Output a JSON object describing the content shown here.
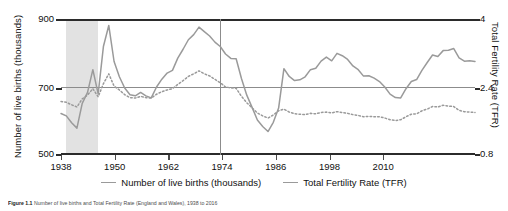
{
  "chart_data": {
    "type": "line",
    "title": "",
    "xlabel": "",
    "ylabel": "Number of live births (thousands)",
    "y2label": "Total Fertility Rate (TFR)",
    "xlim": [
      1938,
      2016
    ],
    "ylim": [
      500,
      900
    ],
    "y2lim": [
      0.8,
      4
    ],
    "xticks": [
      "1938",
      "1950",
      "1962",
      "1974",
      "1986",
      "1998",
      "2010"
    ],
    "yticks": [
      "500",
      "700",
      "900"
    ],
    "y2ticks": [
      "0.8",
      "2.4",
      "4"
    ],
    "grid": false,
    "legend_position": "bottom",
    "annotations": {
      "shaded_band_label": "WWII shaded period",
      "shaded_band_range": [
        1939,
        1945
      ],
      "vertical_reference_year": 1968,
      "horizontal_reference": {
        "births": 700,
        "tfr": 2.4
      }
    },
    "series": [
      {
        "name": "Number of live births (thousands)",
        "axis": "left",
        "style": "solid",
        "color": "#9a9a9a",
        "x": [
          1938,
          1939,
          1940,
          1941,
          1942,
          1943,
          1944,
          1945,
          1946,
          1947,
          1948,
          1949,
          1950,
          1951,
          1952,
          1953,
          1954,
          1955,
          1956,
          1957,
          1958,
          1959,
          1960,
          1961,
          1962,
          1963,
          1964,
          1965,
          1966,
          1967,
          1968,
          1969,
          1970,
          1971,
          1972,
          1973,
          1974,
          1975,
          1976,
          1977,
          1978,
          1979,
          1980,
          1981,
          1982,
          1983,
          1984,
          1985,
          1986,
          1987,
          1988,
          1989,
          1990,
          1991,
          1992,
          1993,
          1994,
          1995,
          1996,
          1997,
          1998,
          1999,
          2000,
          2001,
          2002,
          2003,
          2004,
          2005,
          2006,
          2007,
          2008,
          2009,
          2010,
          2011,
          2012,
          2013,
          2014,
          2015,
          2016
        ],
        "values": [
          622,
          615,
          595,
          579,
          652,
          684,
          751,
          680,
          820,
          881,
          775,
          730,
          697,
          677,
          674,
          684,
          674,
          668,
          700,
          723,
          741,
          749,
          785,
          811,
          839,
          854,
          876,
          863,
          850,
          832,
          819,
          797,
          784,
          783,
          725,
          676,
          640,
          603,
          584,
          569,
          596,
          638,
          754,
          731,
          719,
          721,
          730,
          751,
          755,
          776,
          788,
          777,
          799,
          792,
          781,
          762,
          751,
          732,
          733,
          726,
          716,
          700,
          679,
          669,
          668,
          695,
          716,
          722,
          749,
          772,
          794,
          790,
          807,
          808,
          813,
          786,
          776,
          777,
          775
        ]
      },
      {
        "name": "Total Fertility Rate (TFR)",
        "axis": "right",
        "style": "dotted",
        "color": "#9a9a9a",
        "x": [
          1938,
          1939,
          1940,
          1941,
          1942,
          1943,
          1944,
          1945,
          1946,
          1947,
          1948,
          1949,
          1950,
          1951,
          1952,
          1953,
          1954,
          1955,
          1956,
          1957,
          1958,
          1959,
          1960,
          1961,
          1962,
          1963,
          1964,
          1965,
          1966,
          1967,
          1968,
          1969,
          1970,
          1971,
          1972,
          1973,
          1974,
          1975,
          1976,
          1977,
          1978,
          1979,
          1980,
          1981,
          1982,
          1983,
          1984,
          1985,
          1986,
          1987,
          1988,
          1989,
          1990,
          1991,
          1992,
          1993,
          1994,
          1995,
          1996,
          1997,
          1998,
          1999,
          2000,
          2001,
          2002,
          2003,
          2004,
          2005,
          2006,
          2007,
          2008,
          2009,
          2010,
          2011,
          2012,
          2013,
          2014,
          2015,
          2016
        ],
        "values": [
          2.06,
          2.04,
          1.98,
          1.93,
          2.12,
          2.21,
          2.36,
          2.17,
          2.48,
          2.71,
          2.42,
          2.33,
          2.22,
          2.15,
          2.14,
          2.18,
          2.15,
          2.14,
          2.23,
          2.29,
          2.33,
          2.36,
          2.46,
          2.55,
          2.65,
          2.71,
          2.78,
          2.71,
          2.66,
          2.58,
          2.5,
          2.4,
          2.38,
          2.37,
          2.18,
          2.03,
          1.91,
          1.79,
          1.72,
          1.67,
          1.74,
          1.84,
          1.88,
          1.81,
          1.77,
          1.76,
          1.75,
          1.78,
          1.77,
          1.8,
          1.81,
          1.79,
          1.82,
          1.8,
          1.78,
          1.75,
          1.73,
          1.7,
          1.71,
          1.7,
          1.7,
          1.67,
          1.63,
          1.61,
          1.63,
          1.7,
          1.76,
          1.77,
          1.84,
          1.88,
          1.94,
          1.93,
          1.97,
          1.95,
          1.94,
          1.85,
          1.82,
          1.81,
          1.8
        ]
      }
    ]
  },
  "axes": {
    "left_title": "Number of live births (thousands)",
    "right_title": "Total Fertility Rate (TFR)",
    "left_ticks": [
      "900",
      "700",
      "500"
    ],
    "right_ticks": [
      "4",
      "2.4",
      "0.8"
    ],
    "x_ticks": [
      "1938",
      "1950",
      "1962",
      "1974",
      "1986",
      "1998",
      "2010"
    ]
  },
  "legend": {
    "items": [
      {
        "label": "Number of live births (thousands)"
      },
      {
        "label": "Total Fertility Rate (TFR)"
      }
    ]
  },
  "caption": {
    "label": "Figure 1.1",
    "text": "Number of live births and Total Fertility Rate (England and Wales), 1938 to 2016"
  }
}
